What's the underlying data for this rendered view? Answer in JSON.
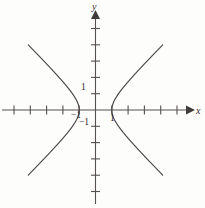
{
  "figure": {
    "title": "",
    "background_color": "#fdfdfc",
    "curve_color": "#4a4648",
    "axis_color": "#555052",
    "label_color": "#2e2b2c"
  },
  "axes": {
    "x_label": "x",
    "y_label": "y",
    "x_arrow": "arrow-right",
    "y_arrow": "arrow-up"
  },
  "tick_labels": {
    "y_one": "1",
    "y_negative_one": "−1",
    "x_one": "1",
    "x_negative_one": "−1"
  },
  "chart_data": {
    "type": "line",
    "title": "",
    "xlabel": "x",
    "ylabel": "y",
    "grid": false,
    "legend": "none",
    "xlim": [
      -5.9,
      6.7
    ],
    "ylim": [
      -5.9,
      6.0
    ],
    "x_ticks": [
      -5,
      -4,
      -3,
      -2,
      -1,
      1,
      2,
      3,
      4,
      5
    ],
    "y_ticks": [
      -5,
      -4,
      -3,
      -2,
      -1,
      1,
      2,
      3,
      4,
      5
    ],
    "x_tick_labels": [
      "",
      "",
      "",
      "",
      "−1",
      "1",
      "",
      "",
      "",
      ""
    ],
    "y_tick_labels": [
      "",
      "",
      "",
      "−1",
      "",
      "1",
      "",
      "",
      "",
      ""
    ],
    "annotations": [],
    "series": [
      {
        "name": "right branch",
        "equation": "x^2 - y^2 = 1, x >= 1",
        "vertex": [
          1,
          0
        ],
        "x": [
          1,
          1.005,
          1.02,
          1.044,
          1.077,
          1.118,
          1.166,
          1.221,
          1.281,
          1.345,
          1.414,
          1.562,
          1.72,
          1.887,
          2.06,
          2.236,
          2.417,
          2.6,
          2.786,
          2.973,
          3.162,
          3.354,
          3.544,
          3.738,
          3.932,
          4.123
        ],
        "y": [
          0,
          0.1,
          0.2,
          0.3,
          0.4,
          0.5,
          0.6,
          0.7,
          0.8,
          0.9,
          1.0,
          1.2,
          1.4,
          1.6,
          1.8,
          2.0,
          2.2,
          2.4,
          2.6,
          2.8,
          3.0,
          3.2,
          3.4,
          3.6,
          3.8,
          4.0
        ]
      },
      {
        "name": "left branch",
        "equation": "x^2 - y^2 = 1, x <= -1",
        "vertex": [
          -1,
          0
        ],
        "x": [
          -1,
          -1.005,
          -1.02,
          -1.044,
          -1.077,
          -1.118,
          -1.166,
          -1.221,
          -1.281,
          -1.345,
          -1.414,
          -1.562,
          -1.72,
          -1.887,
          -2.06,
          -2.236,
          -2.417,
          -2.6,
          -2.786,
          -2.973,
          -3.162,
          -3.354,
          -3.544,
          -3.738,
          -3.932,
          -4.123
        ],
        "y": [
          0,
          0.1,
          0.2,
          0.3,
          0.4,
          0.5,
          0.6,
          0.7,
          0.8,
          0.9,
          1.0,
          1.2,
          1.4,
          1.6,
          1.8,
          2.0,
          2.2,
          2.4,
          2.6,
          2.8,
          3.0,
          3.2,
          3.4,
          3.6,
          3.8,
          4.0
        ]
      }
    ]
  }
}
